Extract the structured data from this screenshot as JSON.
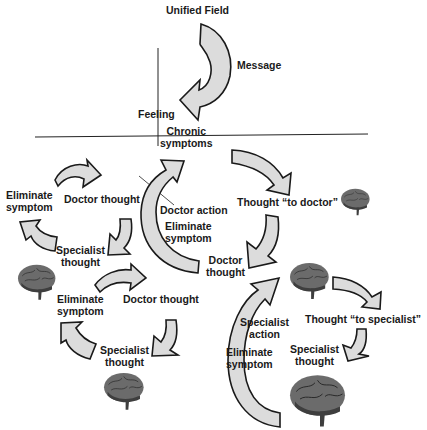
{
  "diagram": {
    "top": {
      "source": "Unified Field",
      "arrow_label": "Message",
      "feeling": "Feeling",
      "chronic_line1": "Chronic",
      "chronic_line2": "symptoms"
    },
    "left_cycle": {
      "eliminate_1_line1": "Eliminate",
      "eliminate_1_line2": "symptom",
      "doctor_thought_1": "Doctor thought",
      "specialist_thought_1_line1": "Specialist",
      "specialist_thought_1_line2": "thought",
      "eliminate_2_line1": "Eliminate",
      "eliminate_2_line2": "symptom",
      "doctor_thought_2": "Doctor thought",
      "specialist_thought_2_line1": "Specialist",
      "specialist_thought_2_line2": "thought"
    },
    "center": {
      "doctor_action": "Doctor action",
      "eliminate_line1": "Eliminate",
      "eliminate_line2": "symptom",
      "doctor_thought_line1": "Doctor",
      "doctor_thought_line2": "thought"
    },
    "right": {
      "thought_to_doctor": "Thought “to doctor”",
      "specialist_action_line1": "Specialist",
      "specialist_action_line2": "action",
      "eliminate_line1": "Eliminate",
      "eliminate_line2": "symptom",
      "thought_to_specialist": "Thought “to specialist”",
      "specialist_thought_line1": "Specialist",
      "specialist_thought_line2": "thought"
    },
    "colors": {
      "arrow_fill": "#dcdcdc",
      "arrow_stroke": "#1a1a1a",
      "text": "#1a1a1a",
      "brain": "#6b6b6b"
    }
  }
}
